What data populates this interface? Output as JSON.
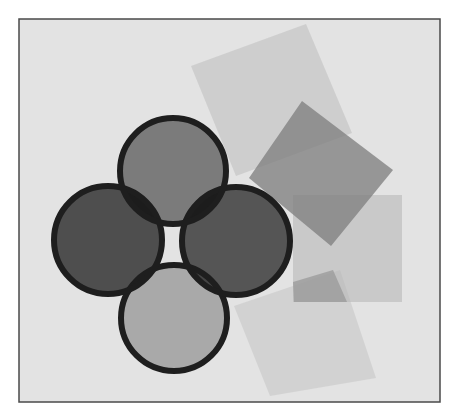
{
  "canvas": {
    "width": 458,
    "height": 417,
    "background": "#ffffff"
  },
  "frame": {
    "x": 19,
    "y": 19,
    "width": 421,
    "height": 383,
    "fill": "#e3e3e3",
    "stroke": "#4a4a4a",
    "stroke_width": 1.5
  },
  "squares": [
    {
      "name": "large-light-square",
      "points": "191,66 306,24 352,133 236,176",
      "fill": "#bdbdbd",
      "opacity": 0.55
    },
    {
      "name": "bottom-light-square",
      "points": "234,306 340,270 376,378 270,396",
      "fill": "#c4c4c4",
      "opacity": 0.55
    },
    {
      "name": "right-light-square",
      "points": "293,195 402,195 402,302 293,302",
      "fill": "#b8b8b8",
      "opacity": 0.6
    },
    {
      "name": "medium-dark-square",
      "points": "302,101 393,170 331,246 249,178",
      "fill": "#7c7c7c",
      "opacity": 0.75
    },
    {
      "name": "small-dark-patch",
      "points": "293,282 333,270 347,302 294,302",
      "fill": "#8e8e8e",
      "opacity": 0.6
    }
  ],
  "circles": [
    {
      "name": "bottom-circle",
      "cx": 174,
      "cy": 318,
      "r": 53,
      "fill": "#a9a9a9"
    },
    {
      "name": "left-circle",
      "cx": 108,
      "cy": 240,
      "r": 54,
      "fill": "#4e4e4e"
    },
    {
      "name": "right-circle",
      "cx": 236,
      "cy": 241,
      "r": 54,
      "fill": "#555555"
    },
    {
      "name": "top-circle",
      "cx": 173,
      "cy": 171,
      "r": 53,
      "fill": "#7b7b7b"
    }
  ],
  "circle_stroke": {
    "color": "#1e1e1e",
    "width": 6
  },
  "overlap_color": "#1c1c1c"
}
